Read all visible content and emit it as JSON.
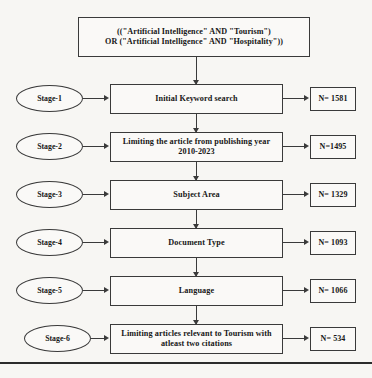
{
  "diagram": {
    "type": "flowchart",
    "title_visible": false,
    "background_color": "#f7f6f3",
    "line_color": "#3a3a3a",
    "text_color": "#161616",
    "query_box": {
      "line1": "((\"Artificial Intelligence\" AND \"Tourism\")",
      "line2": "OR (\"Artificial Intelligence\" AND \"Hospitality\"))"
    },
    "stages": [
      {
        "stage_label": "Stage-1",
        "process_line1": "Initial Keyword search",
        "process_line2": "",
        "result": "N= 1581"
      },
      {
        "stage_label": "Stage-2",
        "process_line1": "Limiting the article from publishing year",
        "process_line2": "2010-2023",
        "result": "N=1495"
      },
      {
        "stage_label": "Stage-3",
        "process_line1": "Subject Area",
        "process_line2": "",
        "result": "N= 1329"
      },
      {
        "stage_label": "Stage-4",
        "process_line1": "Document Type",
        "process_line2": "",
        "result": "N= 1093"
      },
      {
        "stage_label": "Stage-5",
        "process_line1": "Language",
        "process_line2": "",
        "result": "N= 1066"
      },
      {
        "stage_label": "Stage-6",
        "process_line1": "Limiting articles relevant to Tourism with",
        "process_line2": "atleast  two citations",
        "result": "N= 534"
      }
    ]
  }
}
